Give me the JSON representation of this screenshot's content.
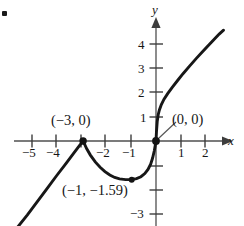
{
  "chart_data": {
    "type": "line",
    "title": "",
    "xlabel": "x",
    "ylabel": "y",
    "grid": false,
    "legend": null,
    "xlim": [
      -5.9,
      2.95
    ],
    "ylim": [
      -3.55,
      4.55
    ],
    "x_ticks": [
      -5,
      -4,
      -3,
      -2,
      -1,
      1,
      2
    ],
    "x_tick_labels": [
      "−5",
      "−4",
      "",
      "−2",
      "−1",
      "1",
      "2"
    ],
    "y_ticks": [
      1,
      2,
      3,
      4,
      -1,
      -2,
      -3
    ],
    "y_tick_labels": [
      "1",
      "2",
      "3",
      "4",
      "",
      "",
      "−3"
    ],
    "annotations": [
      {
        "text": "(−3, 0)",
        "point": [
          -3,
          0
        ]
      },
      {
        "text": "(0, 0)",
        "point": [
          0,
          0
        ]
      },
      {
        "text": "(−1, −1.59)",
        "point": [
          -1,
          -1.59
        ]
      }
    ],
    "marked_points": [
      {
        "x": -3,
        "y": 0,
        "kind": "cusp"
      },
      {
        "x": -1,
        "y": -1.59,
        "kind": "minimum"
      },
      {
        "x": 0,
        "y": 0,
        "kind": "intercept"
      }
    ],
    "series": [
      {
        "name": "curve",
        "color": "#1a1a1a",
        "points": [
          [
            -5.7,
            -3.55
          ],
          [
            -5.3,
            -3.05
          ],
          [
            -4.9,
            -2.52
          ],
          [
            -4.5,
            -1.98
          ],
          [
            -4.1,
            -1.44
          ],
          [
            -3.7,
            -0.92
          ],
          [
            -3.4,
            -0.52
          ],
          [
            -3.15,
            -0.19
          ],
          [
            -3.0,
            0.0
          ],
          [
            -2.85,
            -0.32
          ],
          [
            -2.7,
            -0.58
          ],
          [
            -2.5,
            -0.86
          ],
          [
            -2.3,
            -1.08
          ],
          [
            -2.1,
            -1.26
          ],
          [
            -1.9,
            -1.4
          ],
          [
            -1.7,
            -1.5
          ],
          [
            -1.5,
            -1.56
          ],
          [
            -1.25,
            -1.59
          ],
          [
            -1.0,
            -1.585
          ],
          [
            -0.8,
            -1.55
          ],
          [
            -0.62,
            -1.47
          ],
          [
            -0.46,
            -1.34
          ],
          [
            -0.33,
            -1.17
          ],
          [
            -0.22,
            -0.95
          ],
          [
            -0.14,
            -0.7
          ],
          [
            -0.07,
            -0.4
          ],
          [
            -0.03,
            -0.18
          ],
          [
            0.0,
            0.0
          ],
          [
            0.02,
            0.4
          ],
          [
            0.05,
            0.8
          ],
          [
            0.09,
            1.08
          ],
          [
            0.14,
            1.28
          ],
          [
            0.22,
            1.5
          ],
          [
            0.33,
            1.72
          ],
          [
            0.48,
            1.95
          ],
          [
            0.66,
            2.2
          ],
          [
            0.88,
            2.48
          ],
          [
            1.12,
            2.78
          ],
          [
            1.38,
            3.08
          ],
          [
            1.66,
            3.4
          ],
          [
            1.96,
            3.72
          ],
          [
            2.28,
            4.06
          ],
          [
            2.6,
            4.4
          ],
          [
            2.78,
            4.56
          ]
        ]
      }
    ]
  },
  "axes": {
    "x_axis_name": "x",
    "y_axis_name": "y"
  },
  "decor": {
    "corner_marker": "bullet-marker"
  }
}
